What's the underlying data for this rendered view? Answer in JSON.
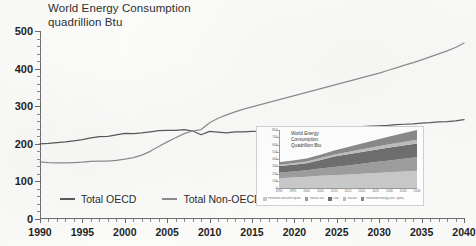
{
  "chart_data": {
    "type": "line",
    "title": "World Energy Consumption",
    "subtitle": "quadrillion Btu",
    "xlabel": "",
    "ylabel": "quadrillion Btu",
    "xlim": [
      1990,
      2040
    ],
    "ylim": [
      0,
      500
    ],
    "ytick_step": 100,
    "xtick_step": 5,
    "grid": false,
    "legend_position": "bottom-left",
    "yticks": [
      "0",
      "100",
      "200",
      "300",
      "400",
      "500"
    ],
    "xticks": [
      "1990",
      "1995",
      "2000",
      "2005",
      "2010",
      "2015",
      "2020",
      "2025",
      "2030",
      "2035",
      "2040"
    ],
    "x": [
      1990,
      1991,
      1992,
      1993,
      1994,
      1995,
      1996,
      1997,
      1998,
      1999,
      2000,
      2001,
      2002,
      2003,
      2004,
      2005,
      2006,
      2007,
      2008,
      2009,
      2010,
      2011,
      2012,
      2013,
      2014,
      2015,
      2016,
      2017,
      2018,
      2019,
      2020,
      2021,
      2022,
      2023,
      2024,
      2025,
      2026,
      2027,
      2028,
      2029,
      2030,
      2031,
      2032,
      2033,
      2034,
      2035,
      2036,
      2037,
      2038,
      2039,
      2040
    ],
    "series": [
      {
        "name": "Total OECD",
        "color": "#5a5a5a",
        "values": [
          200,
          201,
          203,
          205,
          208,
          211,
          216,
          219,
          220,
          224,
          228,
          227,
          229,
          232,
          235,
          236,
          236,
          238,
          234,
          224,
          233,
          231,
          229,
          232,
          232,
          233,
          234,
          236,
          237,
          238,
          238,
          239,
          240,
          241,
          242,
          243,
          244,
          245,
          246,
          247,
          248,
          249,
          251,
          252,
          253,
          255,
          256,
          258,
          259,
          261,
          264
        ]
      },
      {
        "name": "Total Non-OECD",
        "color": "#8d8d8d",
        "values": [
          152,
          150,
          149,
          149,
          150,
          151,
          153,
          154,
          154,
          156,
          159,
          163,
          170,
          180,
          193,
          205,
          216,
          227,
          234,
          238,
          256,
          268,
          277,
          285,
          292,
          298,
          304,
          310,
          316,
          322,
          328,
          334,
          340,
          346,
          352,
          358,
          364,
          370,
          376,
          382,
          388,
          395,
          402,
          409,
          416,
          423,
          431,
          439,
          447,
          456,
          468
        ]
      }
    ],
    "legend": [
      {
        "label": "Total OECD",
        "color": "#5a5a5a"
      },
      {
        "label": "Total Non-OECD",
        "color": "#8d8d8d"
      }
    ]
  },
  "inset_chart": {
    "type": "area",
    "stacked": true,
    "title_lines": [
      "World Energy",
      "Consumption",
      "Quadrillion Btu"
    ],
    "ylim": [
      0,
      800
    ],
    "yticks": [
      "0",
      "100",
      "200",
      "300",
      "400",
      "500",
      "600",
      "700",
      "800"
    ],
    "xticks": [
      "1990",
      "1995",
      "2000",
      "2005",
      "2010",
      "2015",
      "2020",
      "2025",
      "2030",
      "2035",
      "2040"
    ],
    "xlim": [
      1990,
      2040
    ],
    "x": [
      1990,
      1995,
      2000,
      2005,
      2010,
      2015,
      2020,
      2025,
      2030,
      2035,
      2040
    ],
    "series": [
      {
        "name": "Petroleum and other liquids",
        "color": "#c9c9c9",
        "values": [
          135,
          145,
          155,
          168,
          175,
          185,
          196,
          207,
          218,
          228,
          238
        ]
      },
      {
        "name": "Natural Gas",
        "color": "#9e9e9e",
        "values": [
          75,
          82,
          90,
          100,
          113,
          125,
          138,
          150,
          162,
          174,
          186
        ]
      },
      {
        "name": "Coal",
        "color": "#6f6f6f",
        "values": [
          92,
          93,
          95,
          118,
          145,
          155,
          163,
          170,
          177,
          184,
          190
        ]
      },
      {
        "name": "Nuclear",
        "color": "#bdbdbd",
        "values": [
          20,
          23,
          26,
          27,
          28,
          31,
          36,
          41,
          45,
          49,
          53
        ]
      },
      {
        "name": "Renewable Energy (excl. hydro)",
        "color": "#8a8a8a",
        "values": [
          33,
          36,
          40,
          45,
          55,
          68,
          82,
          95,
          108,
          120,
          133
        ]
      }
    ],
    "legend": [
      {
        "label": "Petroleum and other liquids",
        "color": "#c9c9c9"
      },
      {
        "label": "Natural Gas",
        "color": "#9e9e9e"
      },
      {
        "label": "Coal",
        "color": "#6f6f6f"
      },
      {
        "label": "Nuclear",
        "color": "#bdbdbd"
      },
      {
        "label": "Renewable Energy (excl. hydro)",
        "color": "#8a8a8a"
      }
    ]
  }
}
